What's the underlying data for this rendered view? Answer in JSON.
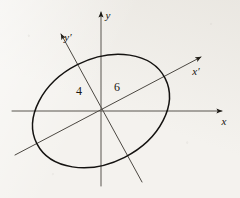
{
  "figure": {
    "background_color": "#f4f2ee",
    "ink_color": "#201c16",
    "axis_color": "#4a4640",
    "curve_color": "#141210"
  },
  "axes": {
    "x": {
      "label": "x",
      "name": "x-axis",
      "x1": 12,
      "y1": 111,
      "x2": 222,
      "y2": 111,
      "label_x": 224,
      "label_y": 125
    },
    "y": {
      "label": "y",
      "name": "y-axis",
      "x1": 101,
      "y1": 186,
      "x2": 101,
      "y2": 12,
      "label_x": 108,
      "label_y": 19
    },
    "x_prime": {
      "label": "x′",
      "name": "x-prime-axis",
      "x1": 15,
      "y1": 155,
      "x2": 201,
      "y2": 57,
      "label_x": 196,
      "label_y": 75
    },
    "y_prime": {
      "label": "y′",
      "name": "y-prime-axis",
      "x1": 142,
      "y1": 182,
      "x2": 61,
      "y2": 34,
      "label_x": 68,
      "label_y": 41
    }
  },
  "ellipse": {
    "name": "rotated-ellipse",
    "center_x": 101,
    "center_y": 111,
    "semi_major": 72,
    "semi_minor": 52,
    "rotation_deg": -27
  },
  "measurements": [
    {
      "id": "semi-minor-label",
      "value": "4",
      "x": 79,
      "y": 95,
      "description": "semi-axis length along y-prime"
    },
    {
      "id": "semi-major-label",
      "value": "6",
      "x": 117,
      "y": 91,
      "description": "semi-axis length along x-prime"
    }
  ],
  "origin": {
    "name": "origin-point",
    "x": 101,
    "y": 111
  }
}
